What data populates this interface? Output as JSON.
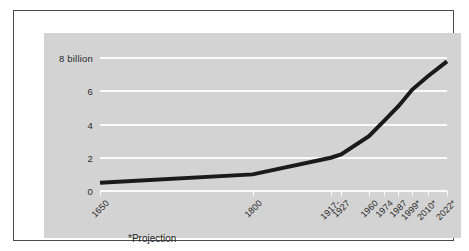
{
  "figure": {
    "footnote": "*Projection",
    "frame_color": "#4a4a52",
    "panel_color": "#d3d3d3",
    "gridline_color": "#fbfbfb",
    "series_color": "#1a1a1a"
  },
  "chart_data": {
    "type": "line",
    "title": "",
    "xlabel": "",
    "ylabel": "",
    "ylim": [
      0,
      8
    ],
    "yticks": [
      0,
      2,
      4,
      6,
      8
    ],
    "ytick_labels": [
      "0",
      "2",
      "4",
      "6",
      "8 billion"
    ],
    "grid": true,
    "legend": "none",
    "annotations": [
      "*Projection"
    ],
    "categories": [
      "1650",
      "1800",
      "1917-",
      "1927",
      "1960",
      "1974",
      "1987",
      "1999*",
      "2010*",
      "2022*"
    ],
    "x": [
      1650,
      1800,
      1917,
      1927,
      1960,
      1974,
      1987,
      1999,
      2010,
      2022
    ],
    "values": [
      0.5,
      1.0,
      2.0,
      2.2,
      3.3,
      4.2,
      5.1,
      6.1,
      6.9,
      7.8
    ],
    "series": [
      {
        "name": "World population",
        "values": [
          0.5,
          1.0,
          2.0,
          2.2,
          3.3,
          4.2,
          5.1,
          6.1,
          6.9,
          7.8
        ]
      }
    ],
    "vertex_points": [
      {
        "label": "1650",
        "value": 0.5
      },
      {
        "label": "1800",
        "value": 1.0
      },
      {
        "label": "1927",
        "value": 2.2
      },
      {
        "label": "2022*",
        "value": 7.8
      }
    ]
  }
}
